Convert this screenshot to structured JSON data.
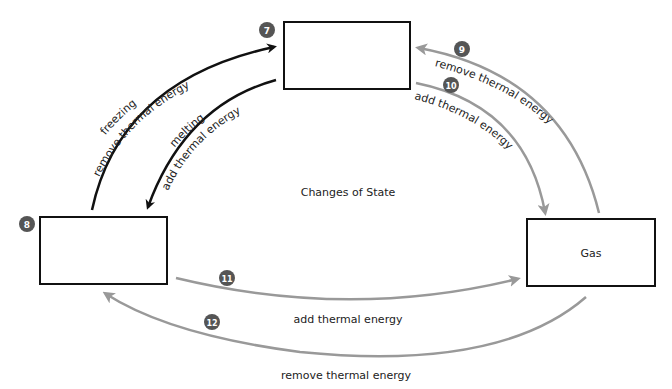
{
  "diagram": {
    "title": "Changes of State",
    "colors": {
      "dark_arrow": "#111111",
      "gray_arrow": "#999999",
      "badge": "#555555",
      "box_border": "#111111"
    },
    "boxes": [
      {
        "id": "top",
        "badge": "7",
        "label": ""
      },
      {
        "id": "left",
        "badge": "8",
        "label": ""
      },
      {
        "id": "right",
        "badge": "",
        "label": "Gas"
      }
    ],
    "arrows": [
      {
        "id": "freezing",
        "process": "freezing",
        "energy": "remove thermal energy"
      },
      {
        "id": "melting",
        "process": "melting",
        "energy": "add thermal energy"
      },
      {
        "id": "gas-to-top",
        "badge": "9",
        "energy": "remove thermal energy"
      },
      {
        "id": "top-to-gas",
        "badge": "10",
        "energy": "add thermal energy"
      },
      {
        "id": "left-to-gas",
        "badge": "11",
        "energy": "add thermal energy"
      },
      {
        "id": "gas-to-left",
        "badge": "12",
        "energy": "remove thermal energy"
      }
    ]
  }
}
